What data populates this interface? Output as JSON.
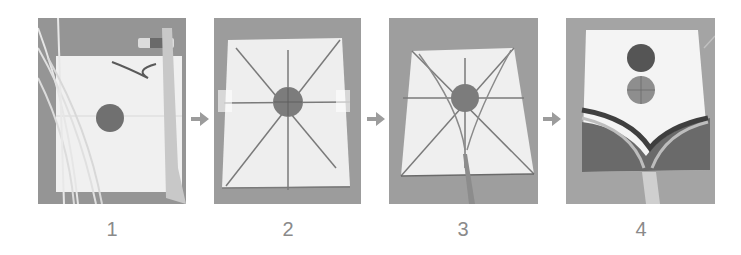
{
  "figure": {
    "title": "",
    "steps": [
      {
        "number": "1",
        "description": "materials: paper sheet with circle, sticks, glue stick, string, tape"
      },
      {
        "number": "2",
        "description": "sticks glued on paper in star pattern"
      },
      {
        "number": "3",
        "description": "bridle and tail attached"
      },
      {
        "number": "4",
        "description": "decorated kite front with circles and arcs"
      }
    ],
    "arrows": [
      "arrow-right",
      "arrow-right",
      "arrow-right"
    ]
  },
  "colors": {
    "background": "#ffffff",
    "photo_bg": "#9a9a9a",
    "paper": "#ebebeb",
    "stick": "#7a7a7a",
    "circle": "#6e6e6e",
    "arrow": "#9c9c9c",
    "number": "#8a8a8a"
  }
}
